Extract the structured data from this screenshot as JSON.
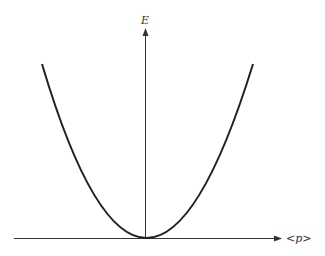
{
  "diagram": {
    "title": "",
    "y_axis_label": "E",
    "x_axis_label": "<p>",
    "curve": "parabola",
    "colors": {
      "axis": "#333333",
      "curve": "#222222",
      "background": "#ffffff"
    }
  }
}
